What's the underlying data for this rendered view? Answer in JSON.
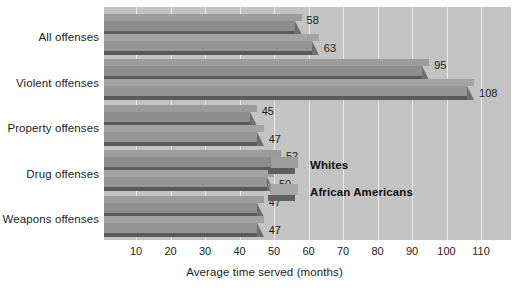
{
  "chart_data": {
    "type": "bar",
    "orientation": "horizontal",
    "title": "",
    "xlabel": "Average time served (months)",
    "ylabel": "",
    "xlim": [
      0,
      118
    ],
    "xticks": [
      10,
      20,
      30,
      40,
      50,
      60,
      70,
      80,
      90,
      100,
      110
    ],
    "grid": true,
    "legend_position": "inside-right",
    "categories": [
      "All offenses",
      "Violent offenses",
      "Property offenses",
      "Drug offenses",
      "Weapons offenses"
    ],
    "series": [
      {
        "name": "Whites",
        "values": [
          58,
          95,
          45,
          52,
          47
        ],
        "color": "#8d8d8d"
      },
      {
        "name": "African Americans",
        "values": [
          63,
          108,
          47,
          50,
          47
        ],
        "color": "#959595"
      }
    ]
  },
  "axis": {
    "x_title": "Average time served (months)",
    "ticks": [
      "10",
      "20",
      "30",
      "40",
      "50",
      "60",
      "70",
      "80",
      "90",
      "100",
      "110"
    ]
  },
  "categories": [
    {
      "label": "All offenses"
    },
    {
      "label": "Violent offenses"
    },
    {
      "label": "Property offenses"
    },
    {
      "label": "Drug offenses"
    },
    {
      "label": "Weapons offenses"
    }
  ],
  "bars": [
    {
      "category": "All offenses",
      "series": "Whites",
      "value": 58,
      "value_label": "58"
    },
    {
      "category": "All offenses",
      "series": "African Americans",
      "value": 63,
      "value_label": "63"
    },
    {
      "category": "Violent offenses",
      "series": "Whites",
      "value": 95,
      "value_label": "95"
    },
    {
      "category": "Violent offenses",
      "series": "African Americans",
      "value": 108,
      "value_label": "108"
    },
    {
      "category": "Property offenses",
      "series": "Whites",
      "value": 45,
      "value_label": "45"
    },
    {
      "category": "Property offenses",
      "series": "African Americans",
      "value": 47,
      "value_label": "47"
    },
    {
      "category": "Drug offenses",
      "series": "Whites",
      "value": 52,
      "value_label": "52"
    },
    {
      "category": "Drug offenses",
      "series": "African Americans",
      "value": 50,
      "value_label": "50"
    },
    {
      "category": "Weapons offenses",
      "series": "Whites",
      "value": 47,
      "value_label": "47"
    },
    {
      "category": "Weapons offenses",
      "series": "African Americans",
      "value": 47,
      "value_label": "47"
    }
  ],
  "legend": {
    "items": [
      {
        "label": "Whites"
      },
      {
        "label": "African Americans"
      }
    ]
  },
  "colors": {
    "plot_background": "#c3c3c3",
    "page_background": "#ffffff",
    "gridline": "#e9e9e9",
    "series_whites": "#8d8d8d",
    "series_african_americans": "#959595",
    "bar_shadow": "#5a5a5a",
    "text": "#1c1c1c"
  }
}
